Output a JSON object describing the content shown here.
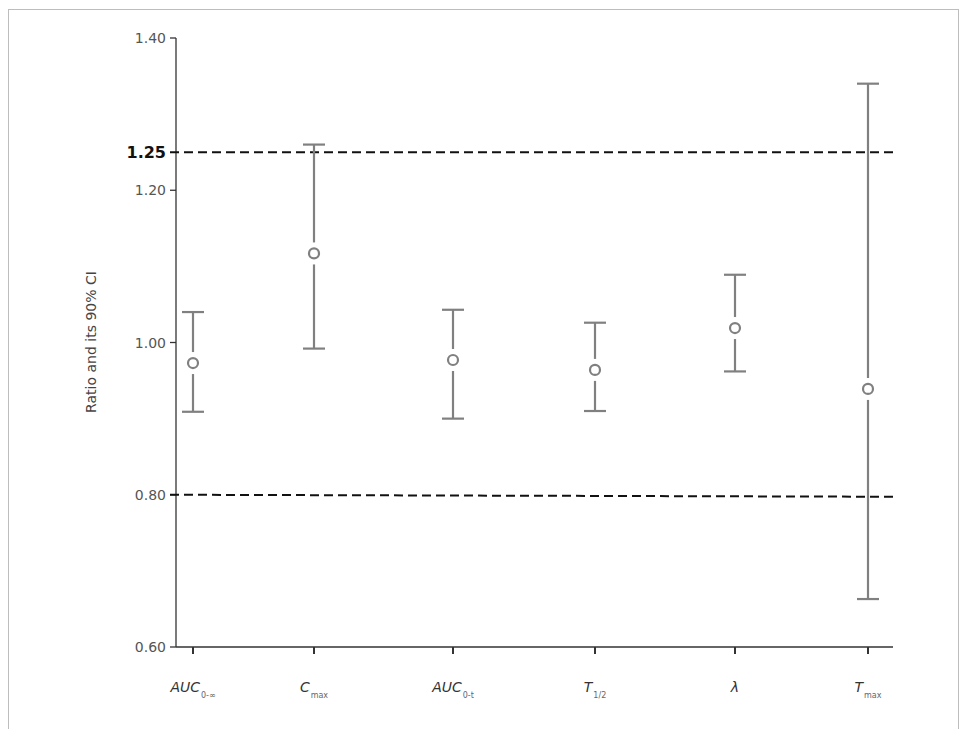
{
  "chart_data": {
    "type": "errorbar",
    "title": "",
    "xlabel": "",
    "ylabel": "Ratio and its 90% CI",
    "ylim": [
      0.6,
      1.4
    ],
    "yticks": [
      {
        "value": 0.6,
        "label": "0.60"
      },
      {
        "value": 0.8,
        "label": "0.80"
      },
      {
        "value": 1.0,
        "label": "1.00"
      },
      {
        "value": 1.2,
        "label": "1.20"
      },
      {
        "value": 1.4,
        "label": "1.40"
      }
    ],
    "reference_lines": [
      {
        "value": 1.25,
        "label": "1.25",
        "style": "dashed",
        "label_bold": true
      },
      {
        "value": 0.8,
        "label": "",
        "style": "dashed"
      }
    ],
    "grid": false,
    "legend": null,
    "categories": [
      {
        "main": "AUC",
        "sub": "0-∞"
      },
      {
        "main": "C",
        "sub": "max"
      },
      {
        "main": "AUC",
        "sub": "0-t"
      },
      {
        "main": "T",
        "sub": "1/2"
      },
      {
        "main": "λ",
        "sub": ""
      },
      {
        "main": "T",
        "sub": "max"
      }
    ],
    "series": [
      {
        "name": "Ratio (90% CI)",
        "point": [
          0.973,
          1.117,
          0.977,
          0.964,
          1.019,
          0.939
        ],
        "lower": [
          0.909,
          0.992,
          0.9,
          0.91,
          0.962,
          0.663
        ],
        "upper": [
          1.04,
          1.26,
          1.043,
          1.026,
          1.089,
          1.34
        ]
      }
    ],
    "colors": {
      "errorbar": "#808080",
      "axis": "#333333",
      "reference_line": "#111111",
      "frame": "#bdbdbd"
    }
  }
}
